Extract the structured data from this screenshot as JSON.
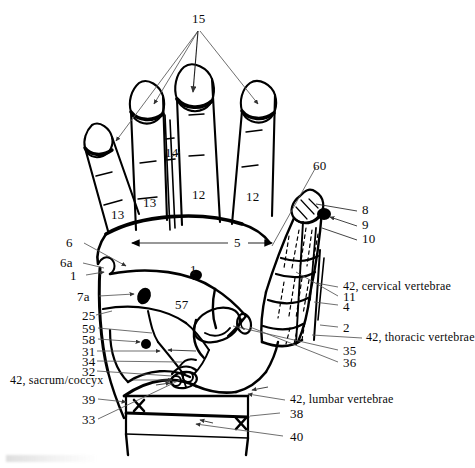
{
  "figure": {
    "background_color": "#ffffff",
    "line_color": "#000000",
    "leader_color": "#555555",
    "width": 475,
    "height": 468
  },
  "labels": {
    "fingertips_group": "15",
    "index_web_marker": "14",
    "finger_little": "13",
    "finger_ring": "13",
    "finger_middle": "12",
    "finger_index": "12",
    "palm_width_dimension": "5",
    "thumb_leader": "60",
    "thumb_tip_8": "8",
    "thumb_tip_9": "9",
    "thumb_tip_10": "10",
    "edge_6": "6",
    "edge_6a": "6a",
    "edge_1_left": "1",
    "palm_dot_1": "1",
    "thenar_7a": "7a",
    "palm_57": "57",
    "edge_25": "25",
    "edge_59": "59",
    "edge_58": "58",
    "edge_31": "31",
    "edge_34": "34",
    "edge_32": "32",
    "sacrum_coccyx": "42, sacrum/coccyx",
    "wrist_39": "39",
    "wrist_33": "33",
    "cervical_vertebrae": "42, cervical vertebrae",
    "joint_11": "11",
    "joint_4": "4",
    "joint_2": "2",
    "thoracic_vertebrae": "42, thoracic vertebrae",
    "joint_35": "35",
    "joint_36": "36",
    "lumbar_vertebrae": "42, lumbar vertebrae",
    "wrist_38": "38",
    "wrist_40": "40"
  }
}
